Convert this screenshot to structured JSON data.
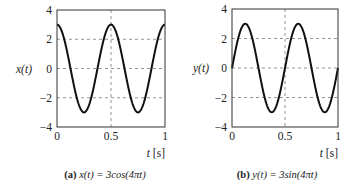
{
  "chart_data": [
    {
      "type": "line",
      "panel": "a",
      "caption_letter": "(a)",
      "caption_formula": "x(t) = 3cos(4πt)",
      "xlabel": "t [s]",
      "ylabel": "x(t)",
      "xlim": [
        0,
        1
      ],
      "ylim": [
        -4,
        4
      ],
      "xticks": [
        "0",
        "0.5",
        "1"
      ],
      "yticks": [
        "4",
        "2",
        "0",
        "−2",
        "−4"
      ],
      "grid": true,
      "series": [
        {
          "name": "x(t)",
          "function": "3cos(4πt)",
          "amplitude": 3,
          "frequency_hz": 2,
          "x": [
            0,
            0.125,
            0.25,
            0.375,
            0.5,
            0.625,
            0.75,
            0.875,
            1
          ],
          "values": [
            3,
            0,
            -3,
            0,
            3,
            0,
            -3,
            0,
            3
          ]
        }
      ]
    },
    {
      "type": "line",
      "panel": "b",
      "caption_letter": "(b)",
      "caption_formula": "y(t) = 3sin(4πt)",
      "xlabel": "t [s]",
      "ylabel": "y(t)",
      "xlim": [
        0,
        1
      ],
      "ylim": [
        -4,
        4
      ],
      "xticks": [
        "0",
        "0.5",
        "1"
      ],
      "yticks": [
        "4",
        "2",
        "0",
        "−2",
        "−4"
      ],
      "grid": true,
      "series": [
        {
          "name": "y(t)",
          "function": "3sin(4πt)",
          "amplitude": 3,
          "frequency_hz": 2,
          "x": [
            0,
            0.125,
            0.25,
            0.375,
            0.5,
            0.625,
            0.75,
            0.875,
            1
          ],
          "values": [
            0,
            3,
            0,
            -3,
            0,
            3,
            0,
            -3,
            0
          ]
        }
      ]
    }
  ]
}
